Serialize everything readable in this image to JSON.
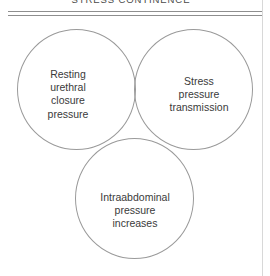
{
  "figure": {
    "title": "STRESS CONTINENCE",
    "line_color": "#9a9a9a",
    "rule_color": "#8e8e8e",
    "text_color": "#3a3a3a",
    "background": "#ffffff"
  },
  "venn": {
    "type": "venn-3-set",
    "sets": [
      {
        "id": "resting-urethral-closure-pressure",
        "position": "top-left",
        "label": "Resting\nurethral\nclosure\npressure"
      },
      {
        "id": "stress-pressure-transmission",
        "position": "top-right",
        "label": "Stress\npressure\ntransmission"
      },
      {
        "id": "intraabdominal-pressure-increases",
        "position": "bottom-center",
        "label": "Intraabdominal\npressure\nincreases"
      }
    ]
  }
}
